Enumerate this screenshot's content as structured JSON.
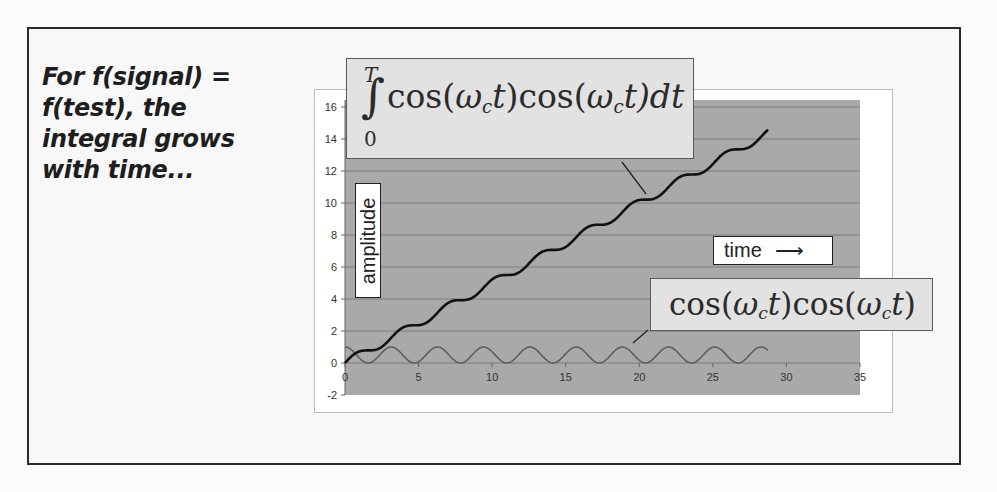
{
  "caption": {
    "lines": [
      "For f(signal) =",
      "f(test), the",
      "integral grows",
      "with time..."
    ]
  },
  "annotations": {
    "integral": {
      "upper_limit": "T",
      "lower_limit": "0",
      "symbol": "∫",
      "cos1": "cos(",
      "omega1": "ω",
      "sub1": "c",
      "t1": "t",
      "mid": ")cos(",
      "omega2": "ω",
      "sub2": "c",
      "t2": "t",
      "tail": ")dt"
    },
    "product": {
      "cos1": "cos(",
      "omega1": "ω",
      "sub1": "c",
      "t1": "t",
      "mid": ")cos(",
      "omega2": "ω",
      "sub2": "c",
      "t2": "t",
      "tail": ")"
    },
    "time_label": "time",
    "time_arrow": "⟶",
    "amplitude_label": "amplitude"
  },
  "colors": {
    "plot_background": "#a9a9a9",
    "gridline": "#7c7c7c",
    "integral_line": "#111111",
    "product_line": "#5e5e5e",
    "frame": "#2a2a2a"
  },
  "chart_data": {
    "type": "line",
    "title": "",
    "xlabel": "time",
    "ylabel": "amplitude",
    "xlim": [
      0,
      35
    ],
    "ylim": [
      -2,
      16
    ],
    "x_ticks": [
      0,
      5,
      10,
      15,
      20,
      25,
      30,
      35
    ],
    "y_ticks": [
      -2,
      0,
      2,
      4,
      6,
      8,
      10,
      12,
      14,
      16
    ],
    "grid": true,
    "legend": "none",
    "series": [
      {
        "name": "integral of cos(ωc t)cos(ωc t) from 0 to T",
        "formula": "t/2 + sin(2t)/4",
        "x_range": [
          0,
          28.8
        ],
        "sample_points": [
          [
            0,
            0
          ],
          [
            5,
            2.4
          ],
          [
            10,
            5.2
          ],
          [
            15,
            7.4
          ],
          [
            20,
            10.2
          ],
          [
            25,
            12.4
          ],
          [
            28.8,
            14.5
          ]
        ]
      },
      {
        "name": "cos(ωc t)cos(ωc t)",
        "formula": "cos(t)^2",
        "x_range": [
          0,
          28.8
        ],
        "y_range": [
          0,
          1
        ],
        "period": 3.14
      }
    ]
  }
}
